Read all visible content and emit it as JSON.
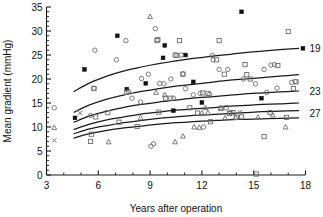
{
  "chart_data": {
    "type": "scatter",
    "title": "",
    "xlabel": "Years after operation",
    "ylabel": "Mean gradient (mmHg)",
    "xlim": [
      3,
      18
    ],
    "ylim": [
      0,
      35
    ],
    "xticks": [
      3,
      6,
      9,
      12,
      15,
      18
    ],
    "xtick_labels": [
      "3",
      "6",
      "9",
      "12",
      "15",
      "18"
    ],
    "xminor_step": 1,
    "yticks": [
      0,
      5,
      10,
      15,
      20,
      25,
      30,
      35
    ],
    "ytick_labels": [
      "0",
      "5",
      "10",
      "15",
      "20",
      "25",
      "30",
      "35"
    ],
    "yminor_step": 1,
    "grid": false,
    "legend_position": "right-inline",
    "curve_labels": [
      {
        "text": "19",
        "x": 18.0,
        "y": 26.4
      },
      {
        "text": "23",
        "x": 18.0,
        "y": 17.4
      },
      {
        "text": "27",
        "x": 18.0,
        "y": 12.9
      }
    ],
    "annotations": [
      {
        "text": "19",
        "note": "fitted curve for 19 mm valve size"
      },
      {
        "text": "23",
        "note": "fitted curve for 23 mm valve size"
      },
      {
        "text": "27",
        "note": "fitted curve for 27 mm valve size"
      }
    ],
    "curves": [
      {
        "name": "19",
        "label": "19",
        "points": [
          [
            4.6,
            17.4
          ],
          [
            5.5,
            19.2
          ],
          [
            6.5,
            20.6
          ],
          [
            7.5,
            21.7
          ],
          [
            8.5,
            22.5
          ],
          [
            9.5,
            23.2
          ],
          [
            10.5,
            23.8
          ],
          [
            11.5,
            24.3
          ],
          [
            12.5,
            24.7
          ],
          [
            13.5,
            25.1
          ],
          [
            14.5,
            25.5
          ],
          [
            15.5,
            25.8
          ],
          [
            16.5,
            26.1
          ],
          [
            17.6,
            26.4
          ]
        ]
      },
      {
        "name": "21",
        "label": "",
        "points": [
          [
            4.6,
            13.1
          ],
          [
            5.5,
            14.6
          ],
          [
            6.5,
            15.8
          ],
          [
            7.5,
            16.7
          ],
          [
            8.5,
            17.4
          ],
          [
            9.5,
            18.0
          ],
          [
            10.5,
            18.5
          ],
          [
            11.5,
            18.9
          ],
          [
            12.5,
            19.3
          ],
          [
            13.5,
            19.7
          ],
          [
            14.5,
            20.0
          ],
          [
            15.5,
            20.3
          ],
          [
            16.5,
            20.6
          ],
          [
            17.6,
            20.9
          ]
        ]
      },
      {
        "name": "23",
        "label": "23",
        "points": [
          [
            4.6,
            11.0
          ],
          [
            5.5,
            12.3
          ],
          [
            6.5,
            13.3
          ],
          [
            7.5,
            14.1
          ],
          [
            8.5,
            14.7
          ],
          [
            9.5,
            15.2
          ],
          [
            10.5,
            15.6
          ],
          [
            11.5,
            16.0
          ],
          [
            12.5,
            16.3
          ],
          [
            13.5,
            16.6
          ],
          [
            14.5,
            16.9
          ],
          [
            15.5,
            17.1
          ],
          [
            16.5,
            17.3
          ],
          [
            17.6,
            17.5
          ]
        ]
      },
      {
        "name": "25",
        "label": "",
        "points": [
          [
            4.6,
            9.5
          ],
          [
            5.5,
            10.6
          ],
          [
            6.5,
            11.5
          ],
          [
            7.5,
            12.1
          ],
          [
            8.5,
            12.7
          ],
          [
            9.5,
            13.1
          ],
          [
            10.5,
            13.5
          ],
          [
            11.5,
            13.8
          ],
          [
            12.5,
            14.0
          ],
          [
            13.5,
            14.3
          ],
          [
            14.5,
            14.5
          ],
          [
            15.5,
            14.7
          ],
          [
            16.5,
            14.8
          ],
          [
            17.6,
            15.0
          ]
        ]
      },
      {
        "name": "27",
        "label": "27",
        "points": [
          [
            4.6,
            8.6
          ],
          [
            5.5,
            9.6
          ],
          [
            6.5,
            10.3
          ],
          [
            7.5,
            10.9
          ],
          [
            8.5,
            11.4
          ],
          [
            9.5,
            11.8
          ],
          [
            10.5,
            12.1
          ],
          [
            11.5,
            12.4
          ],
          [
            12.5,
            12.6
          ],
          [
            13.5,
            12.8
          ],
          [
            14.5,
            13.0
          ],
          [
            15.5,
            13.2
          ],
          [
            16.5,
            13.3
          ],
          [
            17.6,
            13.4
          ]
        ]
      },
      {
        "name": "29",
        "label": "",
        "points": [
          [
            4.6,
            7.7
          ],
          [
            5.5,
            8.6
          ],
          [
            6.5,
            9.3
          ],
          [
            7.5,
            9.8
          ],
          [
            8.5,
            10.2
          ],
          [
            9.5,
            10.6
          ],
          [
            10.5,
            10.9
          ],
          [
            11.5,
            11.1
          ],
          [
            12.5,
            11.3
          ],
          [
            13.5,
            11.5
          ],
          [
            14.5,
            11.6
          ],
          [
            15.5,
            11.7
          ],
          [
            16.5,
            11.8
          ],
          [
            17.6,
            11.9
          ]
        ]
      }
    ],
    "series": [
      {
        "name": "filled-square",
        "marker": "filled-square",
        "color": "#111111",
        "points": [
          [
            4.65,
            11.9
          ],
          [
            5.2,
            22.0
          ],
          [
            7.1,
            29.0
          ],
          [
            7.65,
            17.9
          ],
          [
            8.75,
            19.1
          ],
          [
            9.85,
            27.0
          ],
          [
            9.75,
            24.4
          ],
          [
            10.35,
            13.4
          ],
          [
            11.05,
            25.0
          ],
          [
            11.5,
            19.4
          ],
          [
            12.0,
            15.1
          ],
          [
            14.3,
            34.0
          ],
          [
            15.45,
            16.0
          ],
          [
            17.85,
            26.4
          ]
        ]
      },
      {
        "name": "open-circle",
        "marker": "open-circle",
        "color": "#6d6d6d",
        "points": [
          [
            3.45,
            14.0
          ],
          [
            5.8,
            26.0
          ],
          [
            5.55,
            12.4
          ],
          [
            5.75,
            18.1
          ],
          [
            7.05,
            24.0
          ],
          [
            7.6,
            28.0
          ],
          [
            7.75,
            17.4
          ],
          [
            7.95,
            16.0
          ],
          [
            8.45,
            15.2
          ],
          [
            8.5,
            20.1
          ],
          [
            8.9,
            21.0
          ],
          [
            9.05,
            6.0
          ],
          [
            9.2,
            6.5
          ],
          [
            9.3,
            30.5
          ],
          [
            9.55,
            19.1
          ],
          [
            9.8,
            19.0
          ],
          [
            10.2,
            20.0
          ],
          [
            10.35,
            16.0
          ],
          [
            10.8,
            25.0
          ],
          [
            10.9,
            21.1
          ],
          [
            11.05,
            18.0
          ],
          [
            11.5,
            16.7
          ],
          [
            11.9,
            17.0
          ],
          [
            12.1,
            10.0
          ],
          [
            12.45,
            16.8
          ],
          [
            12.6,
            24.9
          ],
          [
            12.65,
            24.0
          ],
          [
            13.0,
            22.0
          ],
          [
            13.5,
            22.0
          ],
          [
            13.65,
            13.0
          ],
          [
            14.4,
            20.0
          ],
          [
            15.1,
            19.0
          ],
          [
            15.6,
            22.0
          ],
          [
            15.75,
            17.2
          ],
          [
            16.0,
            22.9
          ],
          [
            16.2,
            23.0
          ],
          [
            16.35,
            18.1
          ],
          [
            17.2,
            19.3
          ],
          [
            17.4,
            19.5
          ]
        ]
      },
      {
        "name": "open-square",
        "marker": "open-square",
        "color": "#6d6d6d",
        "points": [
          [
            5.55,
            7.0
          ],
          [
            5.6,
            8.5
          ],
          [
            5.75,
            18.0
          ],
          [
            5.85,
            12.1
          ],
          [
            6.55,
            13.0
          ],
          [
            7.2,
            11.0
          ],
          [
            7.65,
            17.2
          ],
          [
            8.25,
            10.1
          ],
          [
            9.4,
            28.0
          ],
          [
            9.45,
            28.2
          ],
          [
            9.5,
            13.1
          ],
          [
            9.9,
            16.0
          ],
          [
            10.2,
            16.0
          ],
          [
            10.45,
            25.0
          ],
          [
            10.55,
            24.9
          ],
          [
            10.7,
            28.0
          ],
          [
            10.9,
            21.0
          ],
          [
            11.3,
            14.0
          ],
          [
            11.75,
            12.9
          ],
          [
            12.05,
            17.1
          ],
          [
            12.35,
            17.0
          ],
          [
            12.5,
            11.1
          ],
          [
            12.85,
            24.0
          ],
          [
            13.0,
            28.0
          ],
          [
            13.1,
            13.9
          ],
          [
            13.4,
            14.0
          ],
          [
            13.6,
            12.8
          ],
          [
            13.8,
            13.0
          ],
          [
            14.0,
            12.0
          ],
          [
            14.3,
            12.1
          ],
          [
            14.5,
            23.0
          ],
          [
            14.6,
            20.9
          ],
          [
            14.8,
            20.0
          ],
          [
            15.15,
            0.2
          ],
          [
            15.6,
            8.0
          ],
          [
            15.95,
            13.0
          ],
          [
            16.4,
            22.8
          ],
          [
            17.0,
            29.9
          ],
          [
            17.3,
            18.0
          ],
          [
            17.45,
            19.4
          ],
          [
            16.9,
            12.0
          ],
          [
            13.3,
            21.0
          ]
        ]
      },
      {
        "name": "open-triangle",
        "marker": "open-triangle",
        "color": "#6d6d6d",
        "points": [
          [
            3.45,
            9.9
          ],
          [
            6.6,
            6.9
          ],
          [
            8.45,
            11.9
          ],
          [
            9.0,
            33.0
          ],
          [
            9.35,
            17.2
          ],
          [
            9.85,
            16.7
          ],
          [
            10.45,
            6.9
          ],
          [
            10.9,
            8.1
          ],
          [
            11.55,
            10.0
          ],
          [
            11.85,
            9.9
          ],
          [
            12.2,
            14.0
          ],
          [
            12.35,
            13.0
          ],
          [
            13.1,
            14.0
          ],
          [
            13.35,
            11.9
          ],
          [
            13.95,
            12.0
          ],
          [
            15.25,
            12.0
          ],
          [
            16.1,
            12.5
          ],
          [
            16.85,
            10.0
          ],
          [
            12.0,
            12.9
          ]
        ]
      },
      {
        "name": "cross",
        "marker": "cross",
        "color": "#6d6d6d",
        "points": [
          [
            3.45,
            7.2
          ],
          [
            4.95,
            12.9
          ],
          [
            14.2,
            13.1
          ]
        ]
      }
    ]
  }
}
